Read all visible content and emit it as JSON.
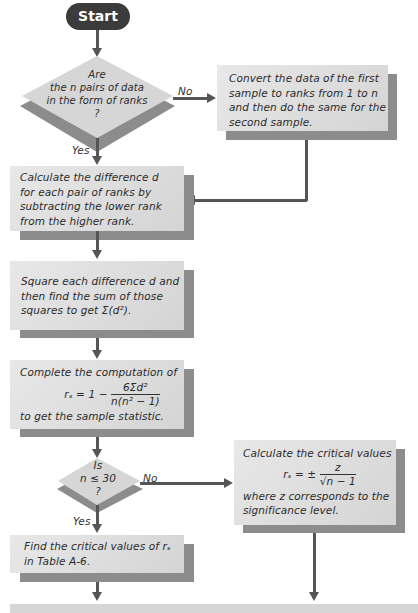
{
  "start": {
    "label": "Start"
  },
  "decision1": {
    "lines": [
      "Are",
      "the n pairs of data",
      "in the form of ranks",
      "?"
    ],
    "yes_label": "Yes",
    "no_label": "No"
  },
  "convert_box": {
    "lines": [
      "Convert the data of the first",
      "sample to ranks from 1 to n",
      "and then do the same for the",
      "second sample."
    ]
  },
  "difference_box": {
    "lines": [
      "Calculate the difference d",
      "for each pair of ranks by",
      "subtracting the lower rank",
      "from the higher rank."
    ]
  },
  "square_box": {
    "lines": [
      "Square each difference d and",
      "then find the sum of those",
      "squares to get Σ(d²)."
    ]
  },
  "compute_box": {
    "intro": "Complete the computation of",
    "formula_lhs": "rₛ = 1 −",
    "formula_num": "6Σd²",
    "formula_den": "n(n² − 1)",
    "outro": "to get the sample statistic."
  },
  "decision2": {
    "lines": [
      "Is",
      "n ≤ 30",
      "?"
    ],
    "yes_label": "Yes",
    "no_label": "No"
  },
  "critical_calc_box": {
    "intro": "Calculate the critical values",
    "formula_lhs": "rₛ = ±",
    "formula_num": "z",
    "formula_den": "√n − 1",
    "outro_lines": [
      "where z corresponds to the",
      "significance level."
    ]
  },
  "table_box": {
    "lines": [
      "Find the critical values of rₛ",
      "in Table A-6."
    ]
  },
  "colors": {
    "start_fill": "#3b3b3b",
    "box_fill": "#dcdcdc",
    "shadow": "#8c8c8c",
    "arrow": "#555555"
  }
}
